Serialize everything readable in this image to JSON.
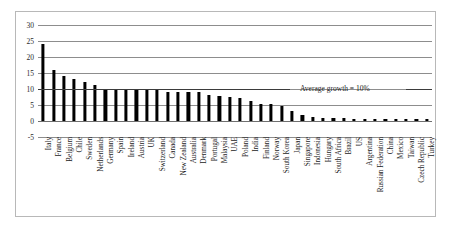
{
  "chart_data": {
    "type": "bar",
    "title": "",
    "xlabel": "",
    "ylabel": "",
    "ylim": [
      -5,
      30
    ],
    "yticks": [
      30,
      25,
      20,
      15,
      10,
      5,
      0,
      -5
    ],
    "grid": true,
    "legend": "none",
    "annotations": [
      {
        "text": "Average growth = 10%",
        "value": 10,
        "style": "horizontal-reference-line"
      }
    ],
    "categories": [
      "Italy",
      "France",
      "Belgium",
      "Chile",
      "Sweden",
      "Netherlands",
      "Germany",
      "Spain",
      "Ireland",
      "Austria",
      "UK",
      "Switzerland",
      "Canada",
      "New Zealand",
      "Australia",
      "Denmark",
      "Portugal",
      "Malaysia",
      "UAE",
      "Poland",
      "India",
      "Finland",
      "Norway",
      "South Korea",
      "Japan",
      "Singapore",
      "Indonesia",
      "Hungary",
      "South Africa",
      "Brazil",
      "US",
      "Argentina",
      "Russian Federation",
      "China",
      "Mexico",
      "Taiwan",
      "Czech Republic",
      "Turkey"
    ],
    "values": [
      24.2,
      16.0,
      14.1,
      13.2,
      12.1,
      11.2,
      10.0,
      10.0,
      10.0,
      10.0,
      10.0,
      9.9,
      9.2,
      9.0,
      9.0,
      9.0,
      8.0,
      7.8,
      7.6,
      7.3,
      6.1,
      5.4,
      5.2,
      4.8,
      3.2,
      1.9,
      1.2,
      1.0,
      0.9,
      0.8,
      0.7,
      0.6,
      0.5,
      0.5,
      0.4,
      0.4,
      0.3,
      0.2
    ]
  },
  "axis": {
    "tick_30": "30",
    "tick_25": "25",
    "tick_20": "20",
    "tick_15": "15",
    "tick_10": "10",
    "tick_5": "5",
    "tick_0": "0",
    "tick_neg5": "-5"
  },
  "annotation": {
    "average_growth": "Average growth = 10%"
  },
  "colors": {
    "bar": "#000000",
    "gridline": "#8d8d8d",
    "frame": "#b8b8b8",
    "text": "#1b1b1b",
    "background": "#ffffff"
  }
}
